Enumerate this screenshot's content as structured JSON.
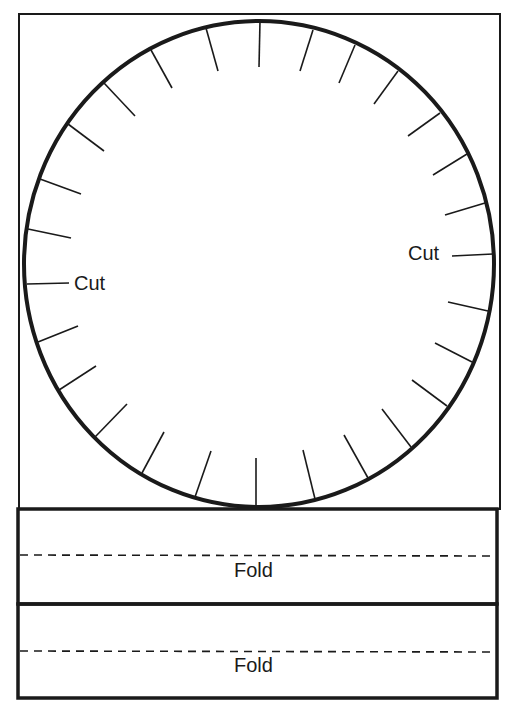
{
  "diagram": {
    "colors": {
      "ink": "#1a1a1a",
      "background": "#ffffff"
    },
    "outer_frame": {
      "x": 19,
      "y": 14,
      "width": 481,
      "height": 495,
      "stroke_width": 2
    },
    "circle": {
      "cx": 259,
      "cy": 264,
      "rx": 235,
      "ry": 243,
      "stroke_width": 4
    },
    "cut_labels": [
      {
        "text": "Cut",
        "side": "left",
        "x": 74,
        "y": 273
      },
      {
        "text": "Cut",
        "side": "right",
        "x": 408,
        "y": 243
      }
    ],
    "ticks": [
      {
        "x1": 206,
        "y1": 28,
        "x2": 218,
        "y2": 71
      },
      {
        "x1": 151,
        "y1": 50,
        "x2": 172,
        "y2": 88
      },
      {
        "x1": 104,
        "y1": 83,
        "x2": 135,
        "y2": 116
      },
      {
        "x1": 68,
        "y1": 124,
        "x2": 104,
        "y2": 151
      },
      {
        "x1": 40,
        "y1": 179,
        "x2": 81,
        "y2": 194
      },
      {
        "x1": 28,
        "y1": 229,
        "x2": 71,
        "y2": 238
      },
      {
        "x1": 260,
        "y1": 21,
        "x2": 259,
        "y2": 67
      },
      {
        "x1": 313,
        "y1": 30,
        "x2": 300,
        "y2": 71
      },
      {
        "x1": 355,
        "y1": 45,
        "x2": 339,
        "y2": 83
      },
      {
        "x1": 398,
        "y1": 71,
        "x2": 374,
        "y2": 104
      },
      {
        "x1": 440,
        "y1": 113,
        "x2": 408,
        "y2": 136
      },
      {
        "x1": 467,
        "y1": 154,
        "x2": 433,
        "y2": 175
      },
      {
        "x1": 485,
        "y1": 203,
        "x2": 445,
        "y2": 215
      },
      {
        "x1": 493,
        "y1": 254,
        "x2": 452,
        "y2": 256
      },
      {
        "x1": 27,
        "y1": 284,
        "x2": 69,
        "y2": 283
      },
      {
        "x1": 38,
        "y1": 342,
        "x2": 78,
        "y2": 326
      },
      {
        "x1": 59,
        "y1": 390,
        "x2": 96,
        "y2": 366
      },
      {
        "x1": 95,
        "y1": 437,
        "x2": 127,
        "y2": 404
      },
      {
        "x1": 142,
        "y1": 473,
        "x2": 164,
        "y2": 432
      },
      {
        "x1": 195,
        "y1": 497,
        "x2": 211,
        "y2": 451
      },
      {
        "x1": 256,
        "y1": 505,
        "x2": 256,
        "y2": 458
      },
      {
        "x1": 315,
        "y1": 499,
        "x2": 303,
        "y2": 450
      },
      {
        "x1": 368,
        "y1": 478,
        "x2": 344,
        "y2": 435
      },
      {
        "x1": 411,
        "y1": 447,
        "x2": 382,
        "y2": 409
      },
      {
        "x1": 447,
        "y1": 406,
        "x2": 412,
        "y2": 380
      },
      {
        "x1": 472,
        "y1": 362,
        "x2": 435,
        "y2": 343
      },
      {
        "x1": 488,
        "y1": 311,
        "x2": 448,
        "y2": 302
      }
    ],
    "fold_bands": [
      {
        "x": 18,
        "y": 509,
        "width": 479,
        "height": 95,
        "dash_y": 555,
        "label": "Fold",
        "label_x": 234,
        "label_y": 560
      },
      {
        "x": 18,
        "y": 604,
        "width": 479,
        "height": 94,
        "dash_y": 651,
        "label": "Fold",
        "label_x": 234,
        "label_y": 655
      }
    ]
  }
}
